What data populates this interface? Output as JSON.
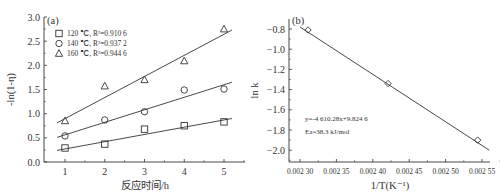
{
  "chart_data": [
    {
      "type": "scatter",
      "panel_label": "(a)",
      "title": "",
      "xlabel": "反应时间/h",
      "ylabel": "-ln(1-η)",
      "xlim": [
        0.5,
        5.5
      ],
      "ylim": [
        0.0,
        3.0
      ],
      "xticks": [
        "1",
        "2",
        "3",
        "4",
        "5"
      ],
      "yticks": [
        "0.0",
        "0.5",
        "1.0",
        "1.5",
        "2.0",
        "2.5",
        "3.0"
      ],
      "grid": false,
      "legend_position": "upper-left",
      "x": [
        1,
        2,
        3,
        4,
        5
      ],
      "series": [
        {
          "name": "120 ℃, R²=0.910 6",
          "marker": "square",
          "values": [
            0.29,
            0.37,
            0.68,
            0.75,
            0.83
          ],
          "fit": {
            "x0": 0.8,
            "y0": 0.24,
            "x1": 5.2,
            "y1": 0.9
          }
        },
        {
          "name": "140 ℃, R²=0.937 2",
          "marker": "circle",
          "values": [
            0.54,
            0.87,
            1.04,
            1.49,
            1.51
          ],
          "fit": {
            "x0": 0.8,
            "y0": 0.51,
            "x1": 5.2,
            "y1": 1.65
          }
        },
        {
          "name": "160 ℃, R²=0.944 6",
          "marker": "triangle",
          "values": [
            0.85,
            1.57,
            1.7,
            2.09,
            2.75
          ],
          "fit": {
            "x0": 0.8,
            "y0": 0.81,
            "x1": 5.2,
            "y1": 2.73
          }
        }
      ]
    },
    {
      "type": "scatter",
      "panel_label": "(b)",
      "title": "",
      "xlabel": "1/T(K⁻¹)",
      "ylabel": "ln k",
      "xlim": [
        0.002285,
        0.002565
      ],
      "ylim": [
        -2.1,
        -0.7
      ],
      "xticks": [
        "0.002 30",
        "0.002 35",
        "0.002 40",
        "0.002 45",
        "0.002 50",
        "0.002 55"
      ],
      "yticks": [
        "-0.8",
        "-1.0",
        "-1.2",
        "-1.4",
        "-1.6",
        "-1.8",
        "-2.0"
      ],
      "grid": false,
      "series": [
        {
          "name": "ln k",
          "marker": "diamond",
          "x": [
            0.002311,
            0.002421,
            0.002544
          ],
          "values": [
            -0.81,
            -1.34,
            -1.9
          ]
        }
      ],
      "fit_line": {
        "x0": 0.0023,
        "y0": -0.78,
        "x1": 0.00256,
        "y1": -2.0
      },
      "annotations": [
        "y=-4 610.28x+9.824 6",
        "Ea=38.3 kJ/mol"
      ]
    }
  ]
}
